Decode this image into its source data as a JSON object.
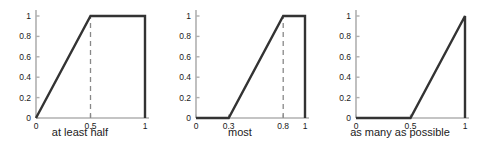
{
  "figure": {
    "name": "fuzzy-quantifier-membership-functions",
    "background": "#ffffff",
    "line_color": "#333333",
    "axis_color": "#b0b0b0",
    "dashed_color": "#888888",
    "tick_label_color": "#1a1a1a",
    "caption_color": "#222222"
  },
  "chart_data": [
    {
      "type": "line",
      "title": "",
      "caption": "at least half",
      "xlabel": "",
      "ylabel": "",
      "xlim": [
        0,
        1
      ],
      "ylim": [
        0,
        1
      ],
      "grid": false,
      "legend": "none",
      "xticks": [
        0,
        0.5,
        1
      ],
      "xtick_labels": [
        "0",
        "0.5",
        "1"
      ],
      "yticks": [
        0,
        0.2,
        0.4,
        0.6,
        0.8,
        1
      ],
      "ytick_labels": [
        "0",
        "0.2",
        "0.4",
        "0.6",
        "0.8",
        "1"
      ],
      "x": [
        0,
        0.5,
        1,
        1
      ],
      "y": [
        0,
        1,
        1,
        0
      ],
      "annotations": [
        {
          "type": "vertical-dashed-line",
          "x": 0.5,
          "y_from": 0,
          "y_to": 1
        }
      ]
    },
    {
      "type": "line",
      "title": "",
      "caption": "most",
      "xlabel": "",
      "ylabel": "",
      "xlim": [
        0,
        1
      ],
      "ylim": [
        0,
        1
      ],
      "grid": false,
      "legend": "none",
      "xticks": [
        0,
        0.3,
        0.8,
        1
      ],
      "xtick_labels": [
        "0",
        "0.3",
        "0.8",
        "1"
      ],
      "yticks": [
        0,
        0.2,
        0.4,
        0.6,
        0.8,
        1
      ],
      "ytick_labels": [
        "0",
        "0.2",
        "0.4",
        "0.6",
        "0.8",
        "1"
      ],
      "x": [
        0,
        0.3,
        0.8,
        1,
        1
      ],
      "y": [
        0,
        0,
        1,
        1,
        0
      ],
      "annotations": [
        {
          "type": "vertical-dashed-line",
          "x": 0.8,
          "y_from": 0,
          "y_to": 1
        }
      ]
    },
    {
      "type": "line",
      "title": "",
      "caption": "as many as possible",
      "xlabel": "",
      "ylabel": "",
      "xlim": [
        0,
        1
      ],
      "ylim": [
        0,
        1
      ],
      "grid": false,
      "legend": "none",
      "xticks": [
        0,
        0.5,
        1
      ],
      "xtick_labels": [
        "0",
        "0.5",
        "1"
      ],
      "yticks": [
        0,
        0.2,
        0.4,
        0.6,
        0.8,
        1
      ],
      "ytick_labels": [
        "0",
        "0.2",
        "0.4",
        "0.6",
        "0.8",
        "1"
      ],
      "x": [
        0,
        0.5,
        1,
        1
      ],
      "y": [
        0,
        0,
        1,
        0
      ],
      "annotations": []
    }
  ]
}
